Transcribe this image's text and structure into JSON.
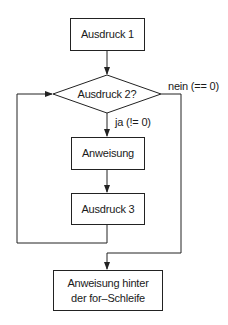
{
  "diagram": {
    "type": "flowchart",
    "nodes": {
      "expr1": {
        "label": "Ausdruck 1",
        "shape": "rectangle"
      },
      "expr2": {
        "label": "Ausdruck 2?",
        "shape": "diamond"
      },
      "statement": {
        "label": "Anweisung",
        "shape": "rectangle"
      },
      "expr3": {
        "label": "Ausdruck 3",
        "shape": "rectangle"
      },
      "after": {
        "label_line1": "Anweisung hinter",
        "label_line2": "der for–Schleife",
        "shape": "rectangle"
      }
    },
    "edges": {
      "no_label": "nein (== 0)",
      "yes_label": "ja (!= 0)"
    },
    "colors": {
      "stroke": "#222222",
      "text": "#1a1a1a",
      "background": "#ffffff"
    }
  }
}
